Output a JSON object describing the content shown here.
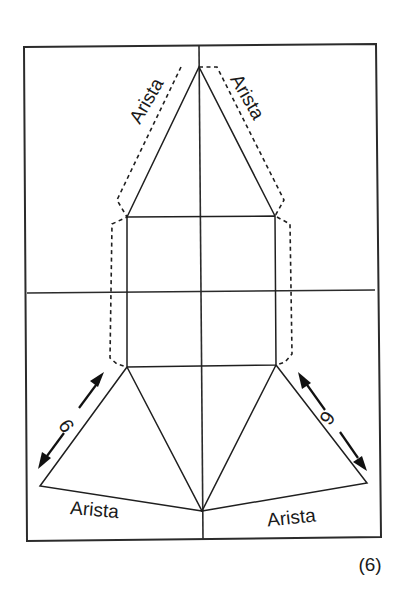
{
  "figure": {
    "number_label": "(6)"
  },
  "labels": {
    "edge_top_left": "Arista",
    "edge_top_right": "Arista",
    "edge_bottom_left": "Arista",
    "edge_bottom_right": "Arista",
    "dimension_left": "9",
    "dimension_right": "9"
  },
  "colors": {
    "line": "#1f1f1f",
    "background": "#ffffff"
  }
}
